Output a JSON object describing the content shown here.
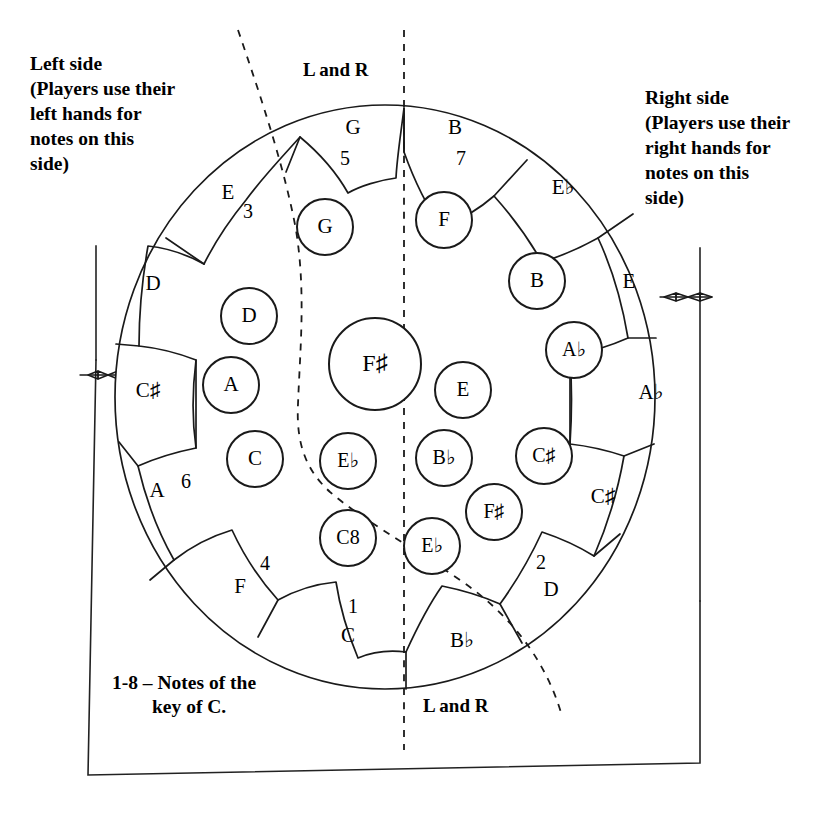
{
  "annotations": {
    "left_side": [
      "Left side",
      "(Players use their",
      "left hands for",
      "notes on this",
      "side)"
    ],
    "right_side": [
      "Right side",
      "(Players use their",
      "right hands for",
      "notes on this",
      "side)"
    ],
    "top_divider_label": "L and R",
    "bottom_divider_label": "L and R",
    "legend": [
      "1-8 – Notes of the",
      "key of C."
    ]
  },
  "outer_ring": [
    {
      "note": "G",
      "degree": "5",
      "nx": 353,
      "ny": 129,
      "dx": 345,
      "dy": 160
    },
    {
      "note": "B",
      "degree": "7",
      "nx": 455,
      "ny": 129,
      "dx": 461,
      "dy": 160
    },
    {
      "note": "E♭",
      "degree": "",
      "nx": 563,
      "ny": 189,
      "dx": 0,
      "dy": 0
    },
    {
      "note": "E",
      "degree": "",
      "nx": 629,
      "ny": 283,
      "dx": 0,
      "dy": 0
    },
    {
      "note": "A♭",
      "degree": "",
      "nx": 651,
      "ny": 394,
      "dx": 0,
      "dy": 0
    },
    {
      "note": "C♯",
      "degree": "",
      "nx": 603,
      "ny": 498,
      "dx": 0,
      "dy": 0
    },
    {
      "note": "D",
      "degree": "2",
      "nx": 551,
      "ny": 591,
      "dx": 541,
      "dy": 564
    },
    {
      "note": "B♭",
      "degree": "",
      "nx": 462,
      "ny": 642,
      "dx": 0,
      "dy": 0
    },
    {
      "note": "C",
      "degree": "1",
      "nx": 348,
      "ny": 637,
      "dx": 353,
      "dy": 608
    },
    {
      "note": "F",
      "degree": "4",
      "nx": 240,
      "ny": 588,
      "dx": 265,
      "dy": 565
    },
    {
      "note": "A",
      "degree": "6",
      "nx": 157,
      "ny": 492,
      "dx": 186,
      "dy": 483
    },
    {
      "note": "C♯",
      "degree": "",
      "nx": 148,
      "ny": 392,
      "dx": 0,
      "dy": 0
    },
    {
      "note": "D",
      "degree": "",
      "nx": 153,
      "ny": 285,
      "dx": 0,
      "dy": 0
    },
    {
      "note": "E",
      "degree": "3",
      "nx": 228,
      "ny": 194,
      "dx": 248,
      "dy": 213
    }
  ],
  "inner_buttons": [
    {
      "note": "G",
      "cx": 325,
      "cy": 227,
      "r": 28
    },
    {
      "note": "F",
      "cx": 444,
      "cy": 220,
      "r": 28
    },
    {
      "note": "D",
      "cx": 249,
      "cy": 316,
      "r": 28
    },
    {
      "note": "B",
      "cx": 537,
      "cy": 281,
      "r": 28
    },
    {
      "note": "A♭",
      "cx": 574,
      "cy": 350,
      "r": 28
    },
    {
      "note": "F♯",
      "cx": 375,
      "cy": 364,
      "r": 46
    },
    {
      "note": "A",
      "cx": 231,
      "cy": 385,
      "r": 28
    },
    {
      "note": "E",
      "cx": 463,
      "cy": 390,
      "r": 28
    },
    {
      "note": "C",
      "cx": 255,
      "cy": 459,
      "r": 28
    },
    {
      "note": "E♭",
      "cx": 348,
      "cy": 461,
      "r": 28
    },
    {
      "note": "B♭",
      "cx": 444,
      "cy": 458,
      "r": 28
    },
    {
      "note": "C♯",
      "cx": 544,
      "cy": 456,
      "r": 28
    },
    {
      "note": "C8",
      "cx": 348,
      "cy": 538,
      "r": 28
    },
    {
      "note": "F♯",
      "cx": 494,
      "cy": 512,
      "r": 28
    },
    {
      "note": "E♭",
      "cx": 432,
      "cy": 546,
      "r": 28
    }
  ],
  "colors": {
    "ink": "#1a1a1a",
    "paper": "#ffffff"
  }
}
